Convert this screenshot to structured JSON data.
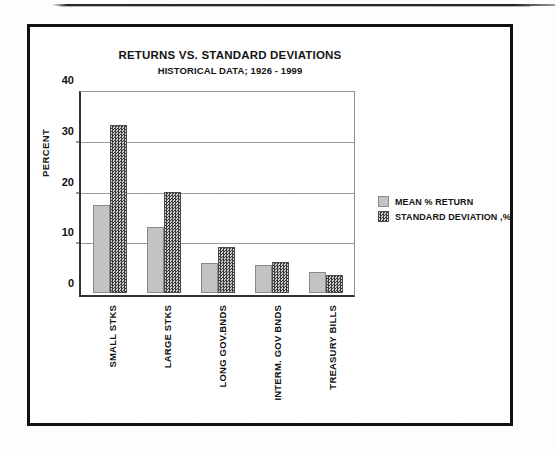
{
  "figure": {
    "title": "RETURNS VS. STANDARD DEVIATIONS",
    "subtitle": "HISTORICAL DATA; 1926 - 1999"
  },
  "colors": {
    "mean_fill": "#c3c3c3",
    "stdev_fill": "#6f6f6f",
    "frame": "#111111",
    "gridline": "#9a9a9a",
    "text": "#141414"
  },
  "legend": {
    "position": "right",
    "entries": [
      {
        "label": "MEAN % RETURN",
        "swatch": "light-gray-solid-swatch"
      },
      {
        "label": "STANDARD DEVIATION ,%",
        "swatch": "dark-checkered-swatch"
      }
    ]
  },
  "chart_data": {
    "type": "bar",
    "title": "RETURNS VS. STANDARD DEVIATIONS",
    "subtitle": "HISTORICAL DATA; 1926 - 1999",
    "xlabel": "",
    "ylabel": "PERCENT",
    "ylim": [
      0,
      40
    ],
    "yticks": [
      0,
      10,
      20,
      30,
      40
    ],
    "grid": true,
    "grid_axis": "y",
    "categories": [
      "SMALL STKS",
      "LARGE STKS",
      "LONG GOV.BNDS",
      "INTERM. GOV BNDS",
      "TREASURY BILLS"
    ],
    "series": [
      {
        "name": "MEAN % RETURN",
        "values": [
          17.6,
          13.3,
          6.0,
          5.7,
          4.2
        ]
      },
      {
        "name": "STANDARD DEVIATION ,%",
        "values": [
          33.6,
          20.2,
          9.3,
          6.2,
          3.7
        ]
      }
    ]
  }
}
